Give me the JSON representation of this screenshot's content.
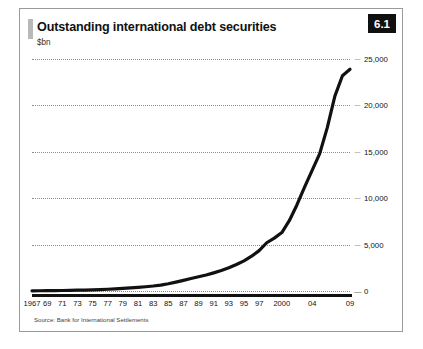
{
  "figure": {
    "badge": "6.1",
    "title": "Outstanding international debt securities",
    "subtitle": "$bn",
    "source": "Source: Bank for International Settlements",
    "accent_color": "#b8b8b8",
    "line_color": "#111111",
    "grid_color": "#8d8d8d",
    "badge_background": "#101010",
    "badge_text_color": "#ffffff",
    "frame_border_color": "#9a9a9a"
  },
  "chart_data": {
    "type": "line",
    "title": "Outstanding international debt securities",
    "subtitle": "$bn",
    "xlabel": "",
    "ylabel": "$bn",
    "ylim": [
      0,
      25000
    ],
    "xlim": [
      1967,
      2009
    ],
    "grid": true,
    "grid_axis": "y",
    "legend": false,
    "y_ticks": [
      0,
      5000,
      10000,
      15000,
      20000,
      25000
    ],
    "y_tick_labels": [
      "0",
      "5,000",
      "10,000",
      "15,000",
      "20,000",
      "25,000"
    ],
    "x_tick_values": [
      1967,
      1969,
      1971,
      1973,
      1975,
      1977,
      1979,
      1981,
      1983,
      1985,
      1987,
      1989,
      1991,
      1993,
      1995,
      1997,
      2000,
      2004,
      2009
    ],
    "x_tick_labels": [
      "1967",
      "69",
      "71",
      "73",
      "75",
      "77",
      "79",
      "81",
      "83",
      "85",
      "87",
      "89",
      "91",
      "93",
      "95",
      "97",
      "2000",
      "04",
      "09"
    ],
    "series": [
      {
        "name": "Outstanding international debt securities",
        "color": "#111111",
        "x": [
          1967,
          1968,
          1969,
          1970,
          1971,
          1972,
          1973,
          1974,
          1975,
          1976,
          1977,
          1978,
          1979,
          1980,
          1981,
          1982,
          1983,
          1984,
          1985,
          1986,
          1987,
          1988,
          1989,
          1990,
          1991,
          1992,
          1993,
          1994,
          1995,
          1996,
          1997,
          1998,
          1999,
          2000,
          2001,
          2002,
          2003,
          2004,
          2005,
          2006,
          2007,
          2008,
          2009
        ],
        "values": [
          20,
          25,
          32,
          40,
          52,
          68,
          85,
          100,
          125,
          155,
          190,
          230,
          280,
          330,
          390,
          460,
          540,
          640,
          780,
          960,
          1150,
          1340,
          1530,
          1720,
          1950,
          2200,
          2500,
          2850,
          3250,
          3750,
          4350,
          5200,
          5700,
          6300,
          7600,
          9300,
          11200,
          13000,
          14800,
          17600,
          21000,
          23200,
          23900
        ]
      }
    ],
    "annotations": []
  }
}
